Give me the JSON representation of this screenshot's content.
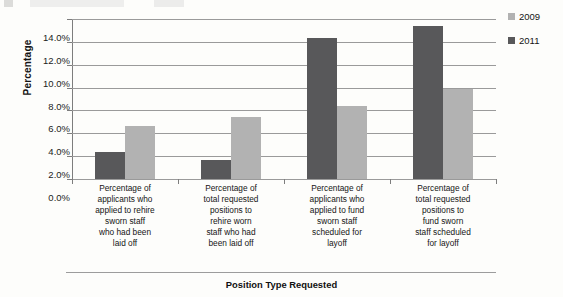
{
  "chart_data": {
    "type": "bar",
    "title": "",
    "xlabel": "Position Type Requested",
    "ylabel": "Percentage",
    "ylim": [
      0,
      14
    ],
    "ytick_labels": [
      "14.0%",
      "12.0%",
      "10.0%",
      "8.0%",
      "6.0%",
      "4.0%",
      "2.0%",
      "0.0%"
    ],
    "ytick_values": [
      14,
      12,
      10,
      8,
      6,
      4,
      2,
      0
    ],
    "grid": true,
    "legend_position": "right",
    "categories": [
      "Percentage of applicants who applied to rehire sworn staff who had been laid off",
      "Percentage of total requested positions to rehire worn staff who had been laid off",
      "Percentage of applicants who applied to fund sworn staff scheduled for layoff",
      "Percentage of total requested positions to fund sworn staff scheduled for layoff"
    ],
    "category_lines": [
      [
        "Percentage of",
        "applicants who",
        "applied to rehire",
        "sworn staff",
        "who had been",
        "laid off"
      ],
      [
        "Percentage of",
        "total requested",
        "positions to",
        "rehire worn",
        "staff who had",
        "been laid off"
      ],
      [
        "Percentage of",
        "applicants who",
        "applied to fund",
        "sworn staff",
        "scheduled for",
        "layoff"
      ],
      [
        "Percentage of",
        "total requested",
        "positions to",
        "fund sworn",
        "staff scheduled",
        "for layoff"
      ]
    ],
    "series": [
      {
        "name": "2011",
        "color": "#58585a",
        "values": [
          2.35,
          1.7,
          12.3,
          13.4
        ]
      },
      {
        "name": "2009",
        "color": "#b2b2b2",
        "values": [
          4.65,
          5.45,
          6.35,
          7.85
        ]
      }
    ]
  },
  "legend": {
    "items": [
      {
        "label": "2009",
        "color": "#b2b2b2"
      },
      {
        "label": "2011",
        "color": "#58585a"
      }
    ]
  }
}
